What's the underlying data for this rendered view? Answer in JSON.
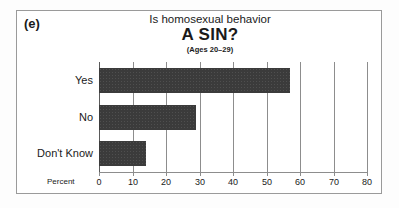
{
  "figure": {
    "panel_label": "(e)",
    "frame_color": "#9a9a9a",
    "background_color": "#ffffff"
  },
  "chart_data": {
    "type": "bar",
    "orientation": "horizontal",
    "title": "Is homosexual behavior A SIN?",
    "title_line1": "Is homosexual behavior",
    "title_line2": "A SIN?",
    "subtitle": "(Ages 20–29)",
    "categories": [
      "Yes",
      "No",
      "Don't Know"
    ],
    "values": [
      57,
      29,
      14
    ],
    "xlabel": "Percent",
    "ylabel": "",
    "xlim": [
      0,
      80
    ],
    "xticks": [
      0,
      10,
      20,
      30,
      40,
      50,
      60,
      70,
      80
    ],
    "xtick_labels": [
      "0",
      "10",
      "20",
      "30",
      "40",
      "50",
      "60",
      "70",
      "80"
    ],
    "grid": true,
    "grid_axis": "x",
    "legend": false,
    "bar_color": "#3b3b3b",
    "grid_color": "#8d8d8d"
  }
}
